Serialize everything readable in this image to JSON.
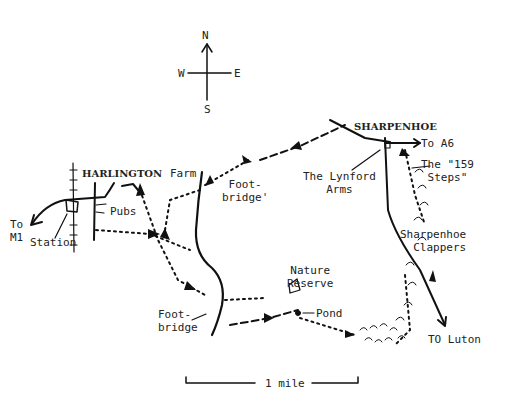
{
  "compass": {
    "north": "N",
    "south": "S",
    "east": "E",
    "west": "W"
  },
  "towns": {
    "harlington": "HARLINGTON",
    "sharpenhoe": "SHARPENHOE"
  },
  "labels": {
    "to_m1_line1": "To",
    "to_m1_line2": "M1",
    "station": "Station",
    "pubs": "Pubs",
    "farm": "Farm",
    "footbridge_north_line1": "Foot-",
    "footbridge_north_line2": "bridge'",
    "lynford_line1": "The Lynford",
    "lynford_line2": "Arms",
    "to_a6": "To A6",
    "steps_line1": "The \"159",
    "steps_line2": "Steps\"",
    "clappers_line1": "Sharpenhoe",
    "clappers_line2": "Clappers",
    "nature_line1": "Nature",
    "nature_line2": "Reserve",
    "pond": "Pond",
    "footbridge_south_line1": "Foot-",
    "footbridge_south_line2": "bridge",
    "to_luton": "TO Luton"
  },
  "scale": {
    "label": "1 mile"
  },
  "colors": {
    "ink": "#111111",
    "paper": "#ffffff"
  }
}
